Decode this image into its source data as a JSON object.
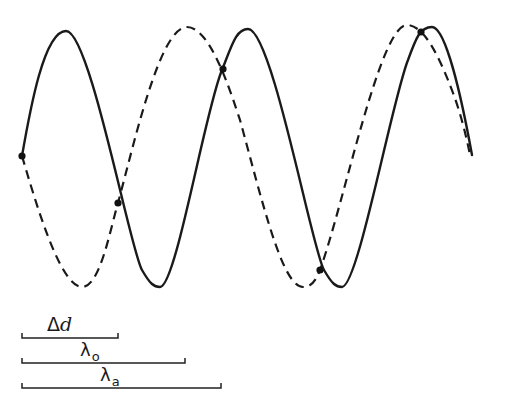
{
  "figure": {
    "curves": [
      {
        "name": "solid-wave",
        "style": "solid",
        "color": "#1a1a1a"
      },
      {
        "name": "dashed-wave",
        "style": "dashed",
        "color": "#1a1a1a"
      }
    ],
    "intersection_points": [
      {
        "x": 22,
        "y": 156
      },
      {
        "x": 118,
        "y": 203
      },
      {
        "x": 223,
        "y": 69
      },
      {
        "x": 320,
        "y": 270
      },
      {
        "x": 421,
        "y": 32
      }
    ],
    "scale_bars": [
      {
        "name": "delta-d",
        "label_main": "Δ",
        "label_italic": "d",
        "x_start": 22,
        "x_end": 118
      },
      {
        "name": "lambda-o",
        "label_main": "λ",
        "label_sub": "o",
        "x_start": 22,
        "x_end": 185
      },
      {
        "name": "lambda-a",
        "label_main": "λ",
        "label_sub": "a",
        "x_start": 22,
        "x_end": 221
      }
    ]
  }
}
